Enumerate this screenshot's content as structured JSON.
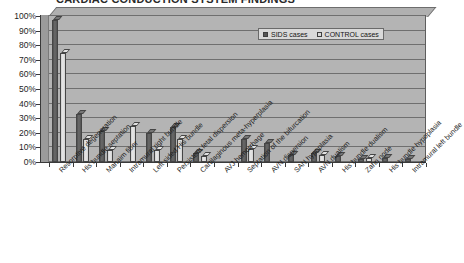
{
  "chart_data": {
    "type": "bar",
    "title": "CARDIAC CONDUCTION SYSTEM FINDINGS",
    "xlabel": "",
    "ylabel": "",
    "ylim": [
      0,
      100
    ],
    "grid": true,
    "legend_position": "top-right",
    "categories": [
      "Resorptive degeneration",
      "His bundle septation",
      "Mahaim fiber",
      "Intramural right bundle",
      "Left sided His bundle",
      "Persistent fetal dispersion",
      "Cartilaginous meta-hyperplasia",
      "AVJ hemorrhage",
      "Septation of the bifurcation",
      "AVN dispersion",
      "SAN hypoplasia",
      "AVN dualism",
      "His bundle dualism",
      "Zahn node",
      "His bundle hypoplasia",
      "Intramural left bundle"
    ],
    "series": [
      {
        "name": "SIDS cases",
        "color": "#555555",
        "values": [
          97,
          33,
          21,
          0,
          20,
          24,
          6,
          0,
          16,
          13,
          5,
          6,
          4,
          2,
          3,
          2
        ]
      },
      {
        "name": "CONTROL cases",
        "color": "#d8d8d8",
        "values": [
          75,
          16,
          8,
          25,
          8,
          16,
          4,
          0,
          9,
          0,
          0,
          5,
          0,
          3,
          0,
          0
        ]
      }
    ],
    "y_ticks": [
      "0%",
      "10%",
      "20%",
      "30%",
      "40%",
      "50%",
      "60%",
      "70%",
      "80%",
      "90%",
      "100%"
    ]
  },
  "legend": {
    "items": [
      {
        "label": "SIDS cases",
        "swatch": "sids"
      },
      {
        "label": "CONTROL cases",
        "swatch": "control"
      }
    ]
  }
}
